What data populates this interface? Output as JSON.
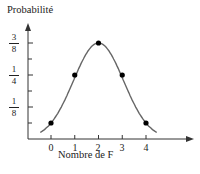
{
  "chart_data": {
    "type": "line",
    "title": "",
    "xlabel": "Nombre de F",
    "ylabel": "Probabilité",
    "categories": [
      "0",
      "1",
      "2",
      "3",
      "4"
    ],
    "x": [
      0,
      1,
      2,
      3,
      4
    ],
    "values": [
      0.0625,
      0.25,
      0.375,
      0.25,
      0.0625
    ],
    "values_fraction": [
      "1/16",
      "1/4",
      "3/8",
      "1/4",
      "1/16"
    ],
    "y_tick_labels": [
      {
        "value": 0.125,
        "num": "1",
        "den": "8"
      },
      {
        "value": 0.25,
        "num": "1",
        "den": "4"
      },
      {
        "value": 0.375,
        "num": "3",
        "den": "8"
      }
    ],
    "y_minor_ticks": [
      0.0625,
      0.1875,
      0.3125
    ],
    "ylim": [
      0,
      0.42
    ],
    "xlim": [
      -1,
      6
    ],
    "grid": false,
    "legend": null,
    "style": {
      "curve_color": "#666666",
      "point_color": "#000000",
      "axis_color": "#333333"
    }
  }
}
